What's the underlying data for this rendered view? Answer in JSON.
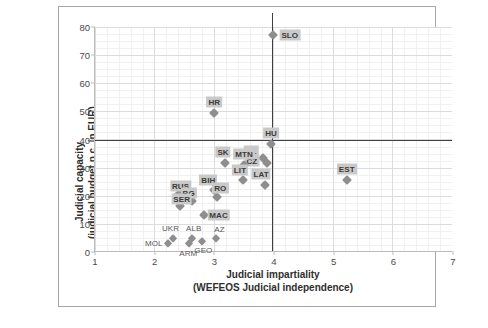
{
  "chart_data": {
    "type": "scatter",
    "title": "",
    "xlabel": "Judicial impartiality",
    "xlabel_sub": "(WEFEOS Judicial independence)",
    "ylabel": "Judicial capacity",
    "ylabel_sub": "(judicial budget p.c. in EUR)",
    "xlim": [
      1,
      7
    ],
    "ylim": [
      0,
      80
    ],
    "xticks": [
      1,
      2,
      3,
      4,
      5,
      6,
      7
    ],
    "yticks": [
      0,
      10,
      20,
      30,
      40,
      50,
      60,
      70,
      80
    ],
    "grid": true,
    "legend": "none",
    "reference_lines": {
      "horizontal_y": 40,
      "vertical_x": 3.97
    },
    "points": [
      {
        "label": "SLO",
        "x": 3.98,
        "y": 77.0,
        "label_dx": 17,
        "label_dy": 0
      },
      {
        "label": "HR",
        "x": 3.0,
        "y": 49.5,
        "label_dx": 0,
        "label_dy": -11
      },
      {
        "label": "HU",
        "x": 3.95,
        "y": 38.5,
        "label_dx": 0,
        "label_dy": -11
      },
      {
        "label": "PL",
        "x": 3.82,
        "y": 33.5,
        "label_dx": -12,
        "label_dy": -7
      },
      {
        "label": "CZ",
        "x": 3.88,
        "y": 31.5,
        "label_dx": -15,
        "label_dy": -2
      },
      {
        "label": "MTN",
        "x": 3.5,
        "y": 31.0,
        "label_dx": 0,
        "label_dy": -11
      },
      {
        "label": "SK",
        "x": 3.18,
        "y": 31.5,
        "label_dx": -2,
        "label_dy": -11
      },
      {
        "label": "EST",
        "x": 5.22,
        "y": 25.5,
        "label_dx": 0,
        "label_dy": -11
      },
      {
        "label": "LIT",
        "x": 3.48,
        "y": 25.5,
        "label_dx": -3,
        "label_dy": -10
      },
      {
        "label": "LAT",
        "x": 3.85,
        "y": 24.0,
        "label_dx": -4,
        "label_dy": -11
      },
      {
        "label": "BIH",
        "x": 3.0,
        "y": 22.0,
        "label_dx": -6,
        "label_dy": -10
      },
      {
        "label": "RO",
        "x": 3.05,
        "y": 19.5,
        "label_dx": 3,
        "label_dy": -9
      },
      {
        "label": "RUS",
        "x": 2.4,
        "y": 20.5,
        "label_dx": 2,
        "label_dy": -8
      },
      {
        "label": "BG",
        "x": 2.62,
        "y": 18.0,
        "label_dx": -3,
        "label_dy": -8
      },
      {
        "label": "SER",
        "x": 2.42,
        "y": 16.5,
        "label_dx": 2,
        "label_dy": -7
      },
      {
        "label": "MAC",
        "x": 2.82,
        "y": 13.0,
        "label_dx": 15,
        "label_dy": 0
      },
      {
        "label": "ALB",
        "x": 2.62,
        "y": 5.0,
        "label_dx": 2,
        "label_dy": -10
      },
      {
        "label": "UKR",
        "x": 2.3,
        "y": 5.0,
        "label_dx": -2,
        "label_dy": -10
      },
      {
        "label": "AZ",
        "x": 3.02,
        "y": 5.0,
        "label_dx": 4,
        "label_dy": -9
      },
      {
        "label": "MOL",
        "x": 2.22,
        "y": 3.2,
        "label_dx": -14,
        "label_dy": 0
      },
      {
        "label": "GEO",
        "x": 2.8,
        "y": 4.0,
        "label_dx": 1,
        "label_dy": 9
      },
      {
        "label": "ARM",
        "x": 2.58,
        "y": 3.2,
        "label_dx": -1,
        "label_dy": 10
      }
    ],
    "plain_labels": [
      "UKR",
      "ALB",
      "AZ",
      "MOL",
      "GEO",
      "ARM"
    ]
  },
  "colors": {
    "marker": "#8e8e8e",
    "label_box": "#c9c9c9",
    "reference_line": "#3f3f3f",
    "grid_major": "#dcdcdc",
    "grid_minor": "#f0f0f0",
    "axis": "#bcbcbc",
    "frame": "#a6a6a6",
    "background": "#ffffff"
  }
}
